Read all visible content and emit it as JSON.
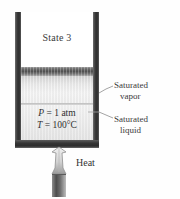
{
  "diagram": {
    "title": "State 3",
    "type": "piston-cylinder-device",
    "state_label": "State 3",
    "properties": {
      "pressure_text": "P = 1 atm",
      "pressure_symbol": "P",
      "pressure_value": "1 atm",
      "temperature_text": "T = 100°C",
      "temperature_symbol": "T",
      "temperature_value": "100°C"
    },
    "labels": {
      "vapor_line1": "Saturated",
      "vapor_line2": "vapor",
      "liquid_line1": "Saturated",
      "liquid_line2": "liquid",
      "heat": "Heat"
    },
    "colors": {
      "wall": "#2e2e2e",
      "piston": "#4e4e4e",
      "vapor": "#e9e9e9",
      "liquid": "#ececec",
      "text": "#2b2b2b",
      "leader": "#8a8a8a",
      "flame": "#c9c9c9"
    }
  }
}
